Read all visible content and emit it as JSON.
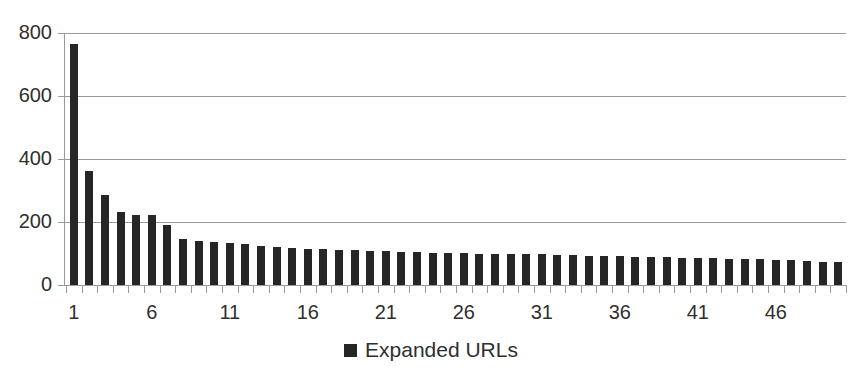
{
  "chart_data": {
    "type": "bar",
    "title": "",
    "subtitle": "",
    "xlabel": "",
    "ylabel": "",
    "ylim": [
      0,
      800
    ],
    "xlim": [
      1,
      50
    ],
    "grid": true,
    "grid_axis": "y",
    "legend_position": "bottom-center",
    "series": [
      {
        "name": "Expanded URLs",
        "color": "#262626",
        "values": [
          765,
          362,
          287,
          232,
          222,
          221,
          190,
          147,
          140,
          135,
          133,
          130,
          124,
          120,
          118,
          115,
          113,
          112,
          110,
          108,
          107,
          106,
          104,
          103,
          102,
          101,
          100,
          99,
          98,
          98,
          97,
          95,
          94,
          93,
          92,
          91,
          90,
          89,
          88,
          87,
          86,
          85,
          84,
          83,
          82,
          80,
          78,
          76,
          74,
          72
        ]
      }
    ],
    "categories": [
      1,
      2,
      3,
      4,
      5,
      6,
      7,
      8,
      9,
      10,
      11,
      12,
      13,
      14,
      15,
      16,
      17,
      18,
      19,
      20,
      21,
      22,
      23,
      24,
      25,
      26,
      27,
      28,
      29,
      30,
      31,
      32,
      33,
      34,
      35,
      36,
      37,
      38,
      39,
      40,
      41,
      42,
      43,
      44,
      45,
      46,
      47,
      48,
      49,
      50
    ],
    "y_ticks": [
      0,
      200,
      400,
      600,
      800
    ],
    "y_tick_labels": [
      "0",
      "200",
      "400",
      "600",
      "800"
    ],
    "x_tick_labels": [
      "1",
      "6",
      "11",
      "16",
      "21",
      "26",
      "31",
      "36",
      "41",
      "46"
    ],
    "x_tick_label_positions": [
      1,
      6,
      11,
      16,
      21,
      26,
      31,
      36,
      41,
      46
    ],
    "legend": [
      {
        "label": "Expanded URLs",
        "color": "#262626",
        "marker": "square"
      }
    ],
    "colors": {
      "bar": "#262626",
      "gridline": "#9a9a9a",
      "axis": "#9a9a9a",
      "text": "#2f2f2f",
      "background": "#ffffff"
    }
  }
}
